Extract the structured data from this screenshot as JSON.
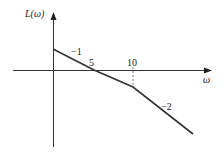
{
  "diagram": {
    "type": "bode-magnitude-asymptote",
    "y_axis_label": "L(ω)",
    "x_axis_label": "ω",
    "tick_labels": [
      "5",
      "10"
    ],
    "slope_labels": [
      "−1",
      "−2"
    ],
    "line_color": "#333333"
  }
}
